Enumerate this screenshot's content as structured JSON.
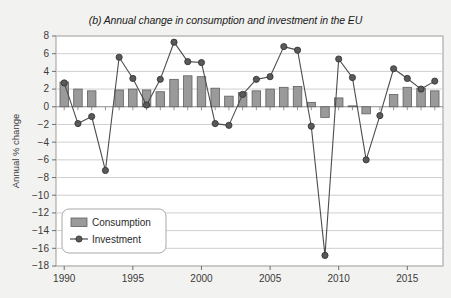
{
  "figure": {
    "title": "(b) Annual change in consumption and investment in the EU",
    "background_color": "#f2f2f0",
    "plot_background_color": "#ffffff"
  },
  "axes": {
    "y_axis_label": "Annual % change",
    "y_ticks": [
      "8",
      "6",
      "4",
      "2",
      "0",
      "-2",
      "-4",
      "-6",
      "-8",
      "-10",
      "-12",
      "-14",
      "-16",
      "-18"
    ],
    "x_ticks": [
      "1990",
      "1995",
      "2000",
      "2005",
      "2010",
      "2015"
    ]
  },
  "legend": {
    "consumption_label": "Consumption",
    "investment_label": "Investment",
    "consumption_swatch_color": "#9a9a9a",
    "investment_line_color": "#4d4d4d"
  },
  "chart_data": {
    "type": "bar",
    "title": "(b) Annual change in consumption and investment in the EU",
    "xlabel": "",
    "ylabel": "Annual % change",
    "ylim": [
      -18,
      8
    ],
    "xlim": [
      1989.4,
      2017.6
    ],
    "ytick_step": 2,
    "grid": true,
    "legend_position": "lower-left",
    "categories": [
      1990,
      1991,
      1992,
      1993,
      1994,
      1995,
      1996,
      1997,
      1998,
      1999,
      2000,
      2001,
      2002,
      2003,
      2004,
      2005,
      2006,
      2007,
      2008,
      2009,
      2010,
      2011,
      2012,
      2013,
      2014,
      2015,
      2016,
      2017
    ],
    "series": [
      {
        "name": "Consumption",
        "type": "bar",
        "color": "#9a9a9a",
        "values": [
          2.8,
          2.0,
          1.8,
          0.0,
          1.9,
          2.0,
          1.9,
          1.7,
          3.1,
          3.5,
          3.4,
          2.1,
          1.2,
          1.6,
          1.8,
          2.0,
          2.2,
          2.3,
          0.5,
          -1.2,
          1.0,
          0.1,
          -0.8,
          0.0,
          1.4,
          2.2,
          2.1,
          1.8
        ]
      },
      {
        "name": "Investment",
        "type": "line",
        "color": "#4d4d4d",
        "marker": "circle",
        "values": [
          2.7,
          -1.9,
          -1.1,
          -7.2,
          5.6,
          3.2,
          0.2,
          3.1,
          7.3,
          5.1,
          5.0,
          -1.9,
          -2.1,
          1.4,
          3.1,
          3.4,
          6.8,
          6.4,
          -2.2,
          -16.8,
          5.4,
          3.3,
          -6.0,
          -1.0,
          4.3,
          3.2,
          2.0,
          2.9
        ]
      }
    ]
  }
}
